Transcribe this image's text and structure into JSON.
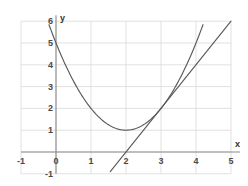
{
  "chart_data": {
    "type": "line",
    "title": "",
    "subtitle": "",
    "xlabel": "x",
    "ylabel": "y",
    "xlim": [
      -1,
      5
    ],
    "ylim": [
      -1,
      6
    ],
    "xticks": [
      -1,
      0,
      1,
      2,
      3,
      4,
      5
    ],
    "xticklabels": [
      "-1",
      "0",
      "1",
      "2",
      "3",
      "4",
      "5"
    ],
    "yticks": [
      -1,
      0,
      1,
      2,
      3,
      4,
      5,
      6
    ],
    "yticklabels": [
      "-1",
      "0",
      "1",
      "2",
      "3",
      "4",
      "5",
      "6"
    ],
    "grid": true,
    "grid_color": "#d9d9d9",
    "axis_color": "#8c8c8c",
    "legend": "none",
    "curve_color": "#5a5a5a",
    "series": [
      {
        "name": "parabola",
        "kind": "quadratic",
        "equation": "y = (x - 2)^2 + 1",
        "vertex": [
          2,
          1
        ],
        "y_intercept": 5,
        "x": [
          -0.2,
          0,
          0.5,
          1,
          1.5,
          2,
          2.5,
          3,
          3.5,
          4,
          4.2
        ],
        "y": [
          5.84,
          5,
          3.25,
          2,
          1.25,
          1,
          1.25,
          2,
          3.25,
          5,
          5.84
        ]
      },
      {
        "name": "tangent-line",
        "kind": "linear",
        "equation": "y = 2x - 4",
        "slope": 2,
        "y_intercept": -4,
        "x_intercept": 2,
        "tangency_point": [
          3,
          2
        ],
        "x": [
          1.55,
          5
        ],
        "y": [
          -0.9,
          6
        ]
      }
    ],
    "annotations": []
  },
  "axis_names": {
    "x": "x",
    "y": "y"
  }
}
